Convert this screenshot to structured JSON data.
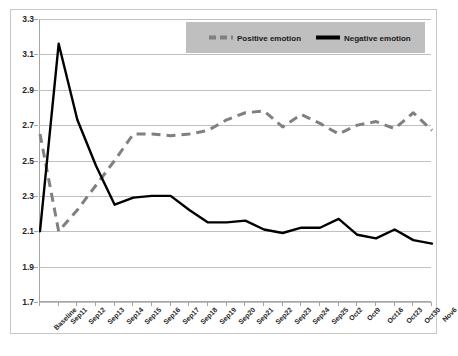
{
  "chart_data": {
    "type": "line",
    "title": "",
    "subtitle": "",
    "xlabel": "",
    "ylabel": "",
    "ylim": [
      1.7,
      3.3
    ],
    "ytick_step": 0.2,
    "yticks": [
      "3.3",
      "3.1",
      "2.9",
      "2.7",
      "2.5",
      "2.3",
      "2.1",
      "1.9",
      "1.7"
    ],
    "grid": "horizontal",
    "legend_position": "top",
    "categories": [
      "Baseline",
      "Sep11",
      "Sep12",
      "Sep13",
      "Sep14",
      "Sep15",
      "Sep16",
      "Sep17",
      "Sep18",
      "Sep19",
      "Sep20",
      "Sep21",
      "Sep22",
      "Sep23",
      "Sep24",
      "Sep25",
      "Oct2",
      "Oct9",
      "Oct16",
      "Oct23",
      "Oct30",
      "Nov6"
    ],
    "series": [
      {
        "name": "Positive emotion",
        "style": "dashed",
        "color": "#808080",
        "values": [
          2.65,
          2.1,
          2.22,
          2.36,
          2.5,
          2.65,
          2.65,
          2.64,
          2.65,
          2.67,
          2.73,
          2.77,
          2.78,
          2.69,
          2.76,
          2.71,
          2.65,
          2.7,
          2.72,
          2.68,
          2.77,
          2.67
        ]
      },
      {
        "name": "Negative emotion",
        "style": "solid",
        "color": "#000000",
        "values": [
          2.1,
          3.16,
          2.73,
          2.47,
          2.25,
          2.29,
          2.3,
          2.3,
          2.22,
          2.15,
          2.15,
          2.16,
          2.11,
          2.09,
          2.12,
          2.12,
          2.17,
          2.08,
          2.06,
          2.11,
          2.05,
          2.03
        ]
      }
    ]
  },
  "legend": {
    "background_color": "#BFBFBF",
    "entries": [
      {
        "label": "Positive emotion",
        "color": "#808080",
        "style": "dashed"
      },
      {
        "label": "Negative emotion",
        "color": "#000000",
        "style": "solid"
      }
    ]
  },
  "colors": {
    "positive_emotion": "#808080",
    "negative_emotion": "#000000",
    "gridline": "#BFBFBF",
    "axis": "#A6A6A6",
    "frame": "#C8C8C8",
    "text": "#262626",
    "plot_background": "#FFFFFF"
  }
}
